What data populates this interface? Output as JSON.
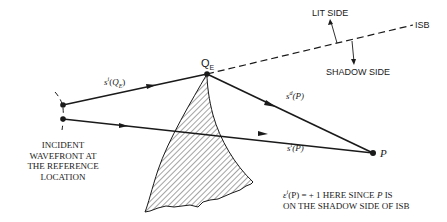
{
  "diagram": {
    "type": "ray-diffraction-geometry",
    "labels": {
      "lit_side": "LIT SIDE",
      "shadow_side": "SHADOW SIDE",
      "isb": "ISB",
      "edge_point": "Q",
      "edge_point_sub": "E",
      "observer_point": "P",
      "incident_to_edge": {
        "base": "s",
        "sup": "i",
        "arg_open": "(",
        "arg": "Q",
        "arg_sub": "E",
        "arg_close": ")"
      },
      "diffracted": {
        "base": "s",
        "sup": "d",
        "arg": "(P)"
      },
      "incident_to_p": {
        "base": "s",
        "sup": "i",
        "arg": "(P)"
      },
      "wavefront_caption": [
        "INCIDENT",
        "WAVEFRONT AT",
        "THE REFERENCE",
        "LOCATION"
      ],
      "note_line1_prefix": "ε",
      "note_line1_sup": "i",
      "note_line1_arg": "(P) = + 1 HERE SINCE ",
      "note_line1_p": "P",
      "note_line1_suffix": " IS",
      "note_line2": "ON THE SHADOW SIDE OF ISB"
    },
    "colors": {
      "ink": "#1a1a1a",
      "background": "#ffffff"
    }
  }
}
